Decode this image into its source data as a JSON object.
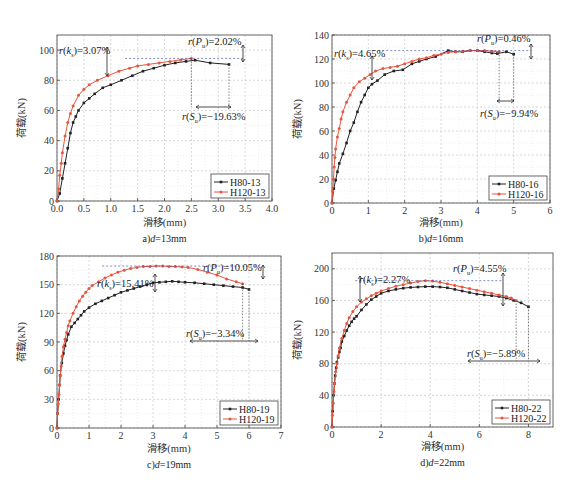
{
  "colors": {
    "h80": "#222222",
    "h120": "#e8553f",
    "grid": "#c8c8c8",
    "peak_marker": "#2a3b9a",
    "frame": "#555555"
  },
  "chart_data": [
    {
      "type": "line",
      "id": "a",
      "caption": "a)d=13mm",
      "caption_parts": {
        "prefix": "a)",
        "var": "d",
        "suffix": "=13mm"
      },
      "xlabel": "滑移(mm)",
      "ylabel": "荷载(kN)",
      "xlim": [
        0,
        4.0
      ],
      "ylim": [
        0,
        110
      ],
      "xticks": [
        0.0,
        0.5,
        1.0,
        1.5,
        2.0,
        2.5,
        3.0,
        3.5,
        4.0
      ],
      "xtick_labels": [
        "0.0",
        "0.5",
        "1.0",
        "1.5",
        "2.0",
        "2.5",
        "3.0",
        "3.5",
        "4.0"
      ],
      "yticks": [
        0,
        20,
        40,
        60,
        80,
        100
      ],
      "grid": true,
      "legend_position": "lower right",
      "series": [
        {
          "name": "H80-13",
          "color": "#222222",
          "x": [
            0,
            0.05,
            0.1,
            0.15,
            0.2,
            0.25,
            0.3,
            0.35,
            0.4,
            0.5,
            0.6,
            0.7,
            0.85,
            1.0,
            1.2,
            1.4,
            1.6,
            1.8,
            2.0,
            2.2,
            2.4,
            2.57,
            2.85,
            3.2
          ],
          "y": [
            0,
            5,
            15,
            25,
            35,
            45,
            52,
            56,
            60,
            65,
            68,
            71,
            75,
            77,
            80,
            83,
            86,
            88,
            90,
            91.5,
            92.5,
            93.3,
            91.5,
            90.5
          ]
        },
        {
          "name": "H120-13",
          "color": "#e8553f",
          "x": [
            0,
            0.03,
            0.05,
            0.08,
            0.1,
            0.15,
            0.2,
            0.25,
            0.3,
            0.4,
            0.5,
            0.6,
            0.75,
            0.95,
            1.15,
            1.35,
            1.5,
            1.7,
            1.9,
            2.1,
            2.3,
            2.5
          ],
          "y": [
            0,
            8,
            17,
            25,
            32,
            43,
            52,
            58,
            63,
            70,
            74,
            77,
            80,
            83,
            86,
            88,
            89.5,
            90.5,
            91.5,
            92.5,
            93.5,
            94.5
          ]
        }
      ],
      "annotations": [
        {
          "label": "r(k_s)=3.07%",
          "sym": "k",
          "sub": "s",
          "value": "3.07%"
        },
        {
          "label": "r(P_u)=2.02%",
          "sym": "P",
          "sub": "u",
          "value": "2.02%"
        },
        {
          "label": "r(S_u)=-19.63%",
          "sym": "S",
          "sub": "u",
          "value": "−19.63%"
        }
      ]
    },
    {
      "type": "line",
      "id": "b",
      "caption": "b)d=16mm",
      "caption_parts": {
        "prefix": "b)",
        "var": "d",
        "suffix": "=16mm"
      },
      "xlabel": "滑移(mm)",
      "ylabel": "荷载(kN)",
      "xlim": [
        0,
        6
      ],
      "ylim": [
        0,
        140
      ],
      "xticks": [
        0,
        1,
        2,
        3,
        4,
        5,
        6
      ],
      "xtick_labels": [
        "0",
        "1",
        "2",
        "3",
        "4",
        "5",
        "6"
      ],
      "yticks": [
        0,
        20,
        40,
        60,
        80,
        100,
        120,
        140
      ],
      "grid": true,
      "legend_position": "lower right",
      "series": [
        {
          "name": "H80-16",
          "color": "#222222",
          "x": [
            0,
            0.05,
            0.1,
            0.15,
            0.2,
            0.3,
            0.4,
            0.5,
            0.6,
            0.7,
            0.8,
            0.9,
            1.0,
            1.1,
            1.25,
            1.45,
            1.7,
            1.95,
            2.2,
            2.4,
            2.6,
            2.85,
            3.2,
            3.4,
            3.6,
            3.8,
            4.0,
            4.2,
            4.4,
            4.55,
            4.8,
            5.0
          ],
          "y": [
            0,
            12,
            19,
            26,
            33,
            41,
            50,
            60,
            67,
            76,
            84,
            90,
            96,
            99,
            102,
            107,
            110,
            111,
            116,
            118,
            120,
            122,
            127,
            126,
            126,
            127,
            127,
            126,
            125,
            124.5,
            126,
            124
          ]
        },
        {
          "name": "H120-16",
          "color": "#e8553f",
          "x": [
            0,
            0.02,
            0.04,
            0.06,
            0.08,
            0.1,
            0.15,
            0.2,
            0.25,
            0.3,
            0.4,
            0.5,
            0.6,
            0.75,
            0.9,
            1.05,
            1.2,
            1.4,
            1.6,
            1.8,
            2.0,
            2.2,
            2.4,
            2.6,
            2.8,
            3.0,
            3.2,
            3.4,
            3.6,
            3.8,
            4.0,
            4.2,
            4.4,
            4.6
          ],
          "y": [
            0,
            10,
            20,
            30,
            38,
            45,
            55,
            62,
            70,
            76,
            84,
            90,
            96,
            101,
            104,
            107,
            110,
            112,
            113,
            114,
            116,
            118,
            120,
            121,
            123,
            124,
            125.5,
            126,
            126.5,
            127,
            127,
            127,
            126.5,
            126
          ]
        }
      ],
      "annotations": [
        {
          "label": "r(k_s)=4.65%",
          "sym": "k",
          "sub": "s",
          "value": "4.65%"
        },
        {
          "label": "r(P_u)=0.46%",
          "sym": "P",
          "sub": "u",
          "value": "0.46%"
        },
        {
          "label": "r(S_u)=-9.94%",
          "sym": "S",
          "sub": "u",
          "value": "−9.94%"
        }
      ]
    },
    {
      "type": "line",
      "id": "c",
      "caption": "c)d=19mm",
      "caption_parts": {
        "prefix": "c)",
        "var": "d",
        "suffix": "=19mm"
      },
      "xlabel": "滑移(mm)",
      "ylabel": "荷载(kN)",
      "xlim": [
        0,
        7
      ],
      "ylim": [
        0,
        180
      ],
      "xticks": [
        0,
        1,
        2,
        3,
        4,
        5,
        6,
        7
      ],
      "xtick_labels": [
        "0",
        "1",
        "2",
        "3",
        "4",
        "5",
        "6",
        "7"
      ],
      "yticks": [
        0,
        30,
        60,
        90,
        120,
        150,
        180
      ],
      "grid": true,
      "legend_position": "lower right",
      "series": [
        {
          "name": "H80-19",
          "color": "#222222",
          "x": [
            0,
            0.02,
            0.05,
            0.08,
            0.1,
            0.15,
            0.2,
            0.25,
            0.3,
            0.35,
            0.45,
            0.55,
            0.65,
            0.75,
            0.85,
            1.0,
            1.2,
            1.4,
            1.6,
            1.8,
            2.0,
            2.2,
            2.4,
            2.6,
            2.8,
            3.0,
            3.2,
            3.4,
            3.6,
            3.8,
            4.0,
            4.3,
            4.6,
            4.9,
            5.2,
            5.5,
            5.8,
            6.0
          ],
          "y": [
            0,
            15,
            30,
            45,
            55,
            68,
            78,
            86,
            92,
            98,
            106,
            110,
            114,
            118,
            122,
            126,
            130,
            133,
            136,
            139,
            142,
            144,
            146,
            148,
            150,
            152,
            152.5,
            153,
            153.5,
            153,
            152.5,
            152,
            151,
            150,
            149,
            148,
            147,
            145
          ]
        },
        {
          "name": "H120-19",
          "color": "#e8553f",
          "x": [
            0,
            0.02,
            0.04,
            0.06,
            0.08,
            0.1,
            0.13,
            0.16,
            0.2,
            0.25,
            0.3,
            0.35,
            0.4,
            0.5,
            0.6,
            0.7,
            0.8,
            0.9,
            1.0,
            1.1,
            1.3,
            1.5,
            1.7,
            1.9,
            2.1,
            2.3,
            2.5,
            2.7,
            2.9,
            3.1,
            3.3,
            3.5,
            3.7,
            3.9,
            4.1,
            4.4,
            4.7,
            5.0,
            5.3,
            5.6,
            5.8
          ],
          "y": [
            0,
            15,
            25,
            35,
            45,
            55,
            65,
            75,
            85,
            93,
            100,
            107,
            112,
            120,
            127,
            133,
            138,
            142,
            146,
            149,
            153,
            157,
            160,
            163,
            165,
            167,
            168,
            169,
            169,
            169.5,
            169.5,
            169,
            169,
            168.5,
            168,
            166,
            163,
            160,
            156,
            153,
            151
          ]
        }
      ],
      "annotations": [
        {
          "label": "r(k_s)=15.41%",
          "sym": "k",
          "sub": "s",
          "value": "15.41%"
        },
        {
          "label": "r(P_u)=10.05%",
          "sym": "P",
          "sub": "u",
          "value": "10.05%"
        },
        {
          "label": "r(S_u)=-3.34%",
          "sym": "S",
          "sub": "u",
          "value": "−3.34%"
        }
      ]
    },
    {
      "type": "line",
      "id": "d",
      "caption": "d)d=22mm",
      "caption_parts": {
        "prefix": "d)",
        "var": "d",
        "suffix": "=22mm"
      },
      "xlabel": "滑移(mm)",
      "ylabel": "荷载(kN)",
      "xlim": [
        0,
        9
      ],
      "ylim": [
        0,
        220
      ],
      "xticks": [
        0,
        2,
        4,
        6,
        8
      ],
      "xtick_labels": [
        "0",
        "2",
        "4",
        "6",
        "8"
      ],
      "yticks": [
        0,
        40,
        80,
        120,
        160,
        200
      ],
      "grid": true,
      "legend_position": "lower right",
      "series": [
        {
          "name": "H80-22",
          "color": "#222222",
          "x": [
            0,
            0.03,
            0.06,
            0.1,
            0.13,
            0.17,
            0.2,
            0.25,
            0.3,
            0.35,
            0.4,
            0.5,
            0.6,
            0.7,
            0.8,
            0.9,
            1.0,
            1.2,
            1.4,
            1.6,
            1.8,
            2.0,
            2.3,
            2.6,
            2.9,
            3.2,
            3.5,
            3.8,
            4.1,
            4.4,
            4.7,
            5.0,
            5.3,
            5.6,
            5.9,
            6.2,
            6.5,
            6.8,
            7.1,
            7.4,
            7.7,
            8.0
          ],
          "y": [
            0,
            20,
            40,
            55,
            65,
            75,
            82,
            88,
            95,
            100,
            108,
            115,
            122,
            128,
            133,
            137,
            140,
            148,
            155,
            161,
            165,
            169,
            172,
            174,
            175.5,
            176.5,
            177,
            177.5,
            177.5,
            177,
            176,
            174,
            172,
            170,
            168,
            167,
            166,
            165,
            163,
            160,
            157,
            152
          ]
        },
        {
          "name": "H120-22",
          "color": "#e8553f",
          "x": [
            0,
            0.02,
            0.05,
            0.08,
            0.1,
            0.15,
            0.2,
            0.25,
            0.3,
            0.4,
            0.5,
            0.6,
            0.7,
            0.85,
            1.0,
            1.2,
            1.4,
            1.6,
            1.8,
            2.0,
            2.3,
            2.6,
            2.9,
            3.2,
            3.5,
            3.8,
            4.1,
            4.4,
            4.7,
            5.0,
            5.3,
            5.6,
            5.9,
            6.2,
            6.5,
            6.8,
            7.1,
            7.3,
            7.5
          ],
          "y": [
            0,
            15,
            30,
            45,
            55,
            70,
            80,
            90,
            100,
            112,
            122,
            131,
            138,
            146,
            152,
            158,
            162,
            166,
            169,
            172,
            175,
            178,
            180,
            182,
            184,
            185,
            184.5,
            183,
            181,
            179,
            177,
            175,
            173,
            171,
            169,
            167,
            165,
            163,
            160
          ]
        }
      ],
      "annotations": [
        {
          "label": "r(k_s)=2.27%",
          "sym": "k",
          "sub": "s",
          "value": "2.27%"
        },
        {
          "label": "r(P_u)=4.55%",
          "sym": "P",
          "sub": "u",
          "value": "4.55%"
        },
        {
          "label": "r(S_u)=-5.89%",
          "sym": "S",
          "sub": "u",
          "value": "−5.89%"
        }
      ]
    }
  ]
}
